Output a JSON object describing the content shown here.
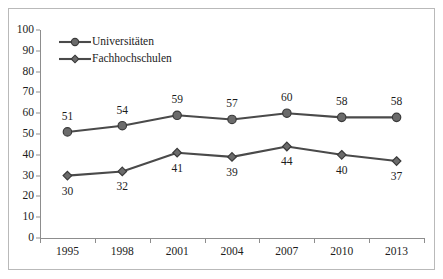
{
  "chart_data": {
    "type": "line",
    "title": "",
    "subtitle": "",
    "xlabel": "",
    "ylabel": "",
    "categories": [
      "1995",
      "1998",
      "2001",
      "2004",
      "2007",
      "2010",
      "2013"
    ],
    "series": [
      {
        "name": "Universitäten",
        "values": [
          51,
          54,
          59,
          57,
          60,
          58,
          58
        ],
        "marker": "circle",
        "color": "#4a4a4a",
        "label_position": "above"
      },
      {
        "name": "Fachhochschulen",
        "values": [
          30,
          32,
          41,
          39,
          44,
          40,
          37
        ],
        "marker": "diamond",
        "color": "#4a4a4a",
        "label_position": "below"
      }
    ],
    "ylim": [
      0,
      100
    ],
    "ytick_step": 10,
    "yticks": [
      "100",
      "90",
      "80",
      "70",
      "60",
      "50",
      "40",
      "30",
      "20",
      "10",
      "0"
    ],
    "grid": false,
    "legend_position": "top-left-inside",
    "axis_color": "#8d8d8d",
    "text_color": "#1c1c1c",
    "frame_color": "#b9b9b9",
    "annotations": []
  }
}
